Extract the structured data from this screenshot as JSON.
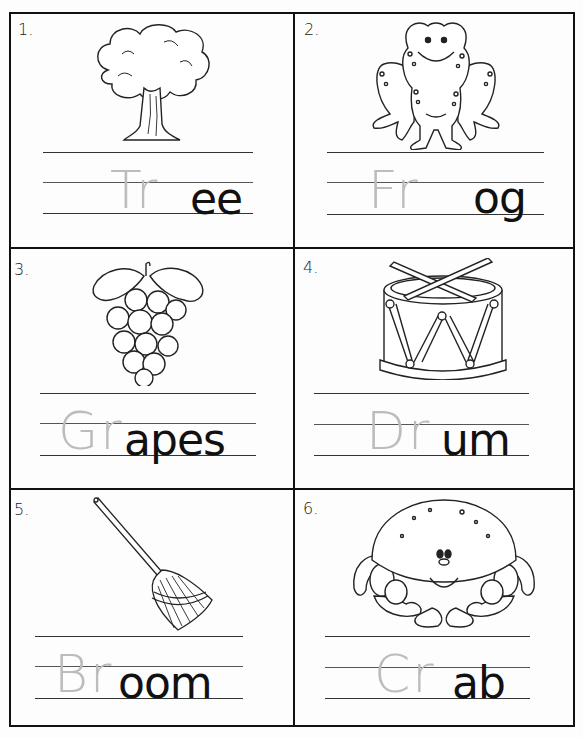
{
  "worksheet": {
    "items": [
      {
        "number": "1.",
        "picture": "tree",
        "handwritten": "Tr",
        "printed": "ee"
      },
      {
        "number": "2.",
        "picture": "frog",
        "handwritten": "Fr",
        "printed": "og"
      },
      {
        "number": "3.",
        "picture": "grapes",
        "handwritten": "Gr",
        "printed": "apes"
      },
      {
        "number": "4.",
        "picture": "drum",
        "handwritten": "Dr",
        "printed": "um"
      },
      {
        "number": "5.",
        "picture": "broom",
        "handwritten": "Br",
        "printed": "oom"
      },
      {
        "number": "6.",
        "picture": "crab",
        "handwritten": "Cr",
        "printed": "ab"
      }
    ]
  },
  "colors": {
    "border": "#111111",
    "printed_text": "#111111",
    "pencil": "#bcbcbc",
    "paper": "#fdfdfd"
  }
}
